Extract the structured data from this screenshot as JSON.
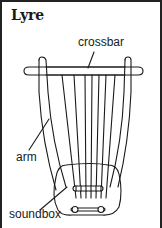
{
  "title": "Lyre",
  "labels": {
    "crossbar": "crossbar",
    "arm": "arm",
    "soundbox": "soundbox"
  },
  "colors": {
    "ink": "#1a1a1a",
    "background": "#ffffff",
    "frame": "#222222"
  },
  "strings": {
    "count": 7
  }
}
